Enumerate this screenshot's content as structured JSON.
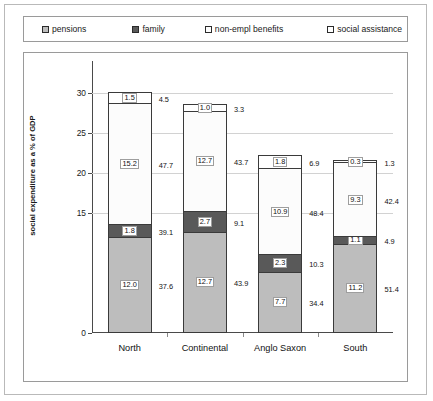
{
  "legend": {
    "items": [
      {
        "label": "pensions",
        "swatch": "pensions-swatch-icon",
        "color": "#bdbdbd"
      },
      {
        "label": "family",
        "swatch": "family-swatch-icon",
        "color": "#5a5a5a"
      },
      {
        "label": "non-empl benefits",
        "swatch": "nonempl-swatch-icon",
        "color": "#fdfdfd"
      },
      {
        "label": "social assistance",
        "swatch": "social-swatch-icon",
        "color": "#ffffff"
      }
    ]
  },
  "axis": {
    "ylabel": "social expenditure as a % of GDP",
    "ticks": [
      "30",
      "25",
      "20",
      "15",
      "0"
    ]
  },
  "chart_data": {
    "type": "bar",
    "subtype": "stacked",
    "title": "",
    "xlabel": "",
    "ylabel": "social expenditure as a % of GDP",
    "ylim": [
      0,
      33.3
    ],
    "ytick_values": [
      0,
      15,
      20,
      25,
      30
    ],
    "ytick_labels": [
      "0",
      "15",
      "20",
      "25",
      "30"
    ],
    "grid": true,
    "legend_position": "top",
    "categories": [
      "North",
      "Continental",
      "Anglo Saxon",
      "South"
    ],
    "series": [
      {
        "name": "pensions",
        "color": "#bdbdbd",
        "values": [
          12.0,
          12.7,
          7.7,
          11.2
        ],
        "value_labels": [
          "12.0",
          "12.7",
          "7.7",
          "11.2"
        ],
        "share_labels": [
          "37.6",
          "43.9",
          "34.4",
          "51.4"
        ]
      },
      {
        "name": "family",
        "color": "#595959",
        "values": [
          1.8,
          2.7,
          2.3,
          1.1
        ],
        "value_labels": [
          "1.8",
          "2.7",
          "2.3",
          "1.1"
        ],
        "share_labels": [
          "39.1",
          "9.1",
          "10.3",
          "4.9"
        ]
      },
      {
        "name": "non-empl benefits",
        "color": "#fcfcfc",
        "values": [
          15.2,
          12.7,
          10.9,
          9.3
        ],
        "value_labels": [
          "15.2",
          "12.7",
          "10.9",
          "9.3"
        ],
        "share_labels": [
          "47.7",
          "43.7",
          "48.4",
          "42.4"
        ]
      },
      {
        "name": "social assistance",
        "color": "#ffffff",
        "values": [
          1.5,
          1.0,
          1.8,
          0.3
        ],
        "value_labels": [
          "1.5",
          "1.0",
          "1.8",
          "0.3"
        ],
        "share_labels": [
          "4.5",
          "3.3",
          "6.9",
          "1.3"
        ]
      }
    ]
  }
}
